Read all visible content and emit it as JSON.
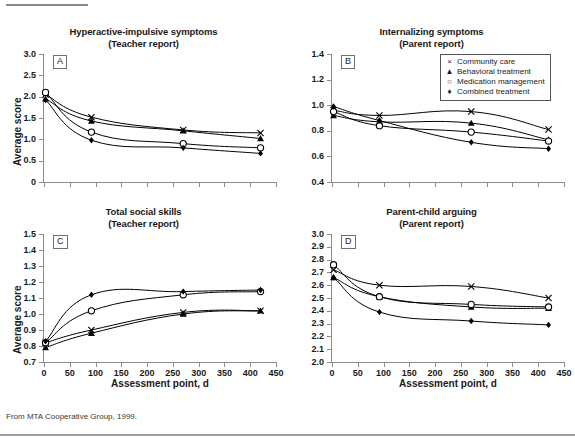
{
  "figure": {
    "top_fragment": "",
    "caption": "From MTA Cooperative Group, 1999.",
    "ylabel": "Average score",
    "xlabel": "Assessment point, d"
  },
  "legend": {
    "items": [
      {
        "marker": "cross-marker",
        "glyph": "×",
        "label": "Community care"
      },
      {
        "marker": "triangle-marker",
        "glyph": "▲",
        "label": "Behavioral treatment"
      },
      {
        "marker": "circle-marker",
        "glyph": "○",
        "label": "Medication management"
      },
      {
        "marker": "diamond-marker",
        "glyph": "♦",
        "label": "Combined treatment"
      }
    ]
  },
  "chart_data": [
    {
      "id": "A",
      "type": "line",
      "title": "Hyperactive-impulsive symptoms",
      "subtitle": "(Teacher report)",
      "xlabel": "Assessment point, d",
      "ylabel": "Average score",
      "xlim": [
        0,
        450
      ],
      "ylim": [
        0,
        3.0
      ],
      "yticks": [
        "0",
        "0.5",
        "1.0",
        "1.5",
        "2.0",
        "2.5",
        "3.0"
      ],
      "ytick_values": [
        0,
        0.5,
        1.0,
        1.5,
        2.0,
        2.5,
        3.0
      ],
      "xticks": [
        "",
        "",
        "",
        "",
        "",
        "",
        "",
        "",
        "",
        ""
      ],
      "xtick_values": [
        0,
        50,
        100,
        150,
        200,
        250,
        300,
        350,
        400,
        450
      ],
      "grid": false,
      "x": [
        3,
        92,
        270,
        420
      ],
      "series": [
        {
          "name": "Community care",
          "marker": "×",
          "values": [
            2.05,
            1.52,
            1.22,
            1.15
          ]
        },
        {
          "name": "Behavioral treatment",
          "marker": "▲",
          "values": [
            1.95,
            1.43,
            1.2,
            1.02
          ]
        },
        {
          "name": "Medication management",
          "marker": "○",
          "values": [
            2.1,
            1.17,
            0.9,
            0.8
          ]
        },
        {
          "name": "Combined treatment",
          "marker": "♦",
          "values": [
            1.92,
            0.98,
            0.8,
            0.67
          ]
        }
      ]
    },
    {
      "id": "B",
      "type": "line",
      "title": "Internalizing symptoms",
      "subtitle": "(Parent report)",
      "xlabel": "Assessment point, d",
      "ylabel": "Average score",
      "xlim": [
        0,
        450
      ],
      "ylim": [
        0.4,
        1.4
      ],
      "yticks": [
        "0.4",
        "0.6",
        "0.8",
        "1.0",
        "1.2",
        "1.4"
      ],
      "ytick_values": [
        0.4,
        0.6,
        0.8,
        1.0,
        1.2,
        1.4
      ],
      "xticks": [
        "",
        "",
        "",
        "",
        "",
        "",
        "",
        "",
        "",
        ""
      ],
      "xtick_values": [
        0,
        50,
        100,
        150,
        200,
        250,
        300,
        350,
        400,
        450
      ],
      "grid": false,
      "x": [
        3,
        92,
        270,
        420
      ],
      "series": [
        {
          "name": "Community care",
          "marker": "×",
          "values": [
            0.96,
            0.92,
            0.95,
            0.81
          ]
        },
        {
          "name": "Behavioral treatment",
          "marker": "▲",
          "values": [
            0.92,
            0.87,
            0.86,
            0.73
          ]
        },
        {
          "name": "Medication management",
          "marker": "○",
          "values": [
            0.95,
            0.84,
            0.79,
            0.72
          ]
        },
        {
          "name": "Combined treatment",
          "marker": "♦",
          "values": [
            0.99,
            0.88,
            0.71,
            0.66
          ]
        }
      ]
    },
    {
      "id": "C",
      "type": "line",
      "title": "Total social skills",
      "subtitle": "(Teacher report)",
      "xlabel": "Assessment point, d",
      "ylabel": "Average score",
      "xlim": [
        0,
        450
      ],
      "ylim": [
        0.7,
        1.5
      ],
      "yticks": [
        "0.7",
        "0.8",
        "0.9",
        "1.0",
        "1.1",
        "1.2",
        "1.3",
        "1.4",
        "1.5"
      ],
      "ytick_values": [
        0.7,
        0.8,
        0.9,
        1.0,
        1.1,
        1.2,
        1.3,
        1.4,
        1.5
      ],
      "xticks": [
        "0",
        "50",
        "100",
        "150",
        "200",
        "250",
        "300",
        "350",
        "400",
        "450"
      ],
      "xtick_values": [
        0,
        50,
        100,
        150,
        200,
        250,
        300,
        350,
        400,
        450
      ],
      "grid": false,
      "x": [
        3,
        92,
        270,
        420
      ],
      "series": [
        {
          "name": "Community care",
          "marker": "×",
          "values": [
            0.82,
            0.9,
            1.01,
            1.02
          ]
        },
        {
          "name": "Behavioral treatment",
          "marker": "▲",
          "values": [
            0.79,
            0.88,
            1.0,
            1.02
          ]
        },
        {
          "name": "Medication management",
          "marker": "○",
          "values": [
            0.82,
            1.02,
            1.12,
            1.14
          ]
        },
        {
          "name": "Combined treatment",
          "marker": "♦",
          "values": [
            0.83,
            1.12,
            1.14,
            1.15
          ]
        }
      ]
    },
    {
      "id": "D",
      "type": "line",
      "title": "Parent-child arguing",
      "subtitle": "(Parent report)",
      "xlabel": "Assessment point, d",
      "ylabel": "Average score",
      "xlim": [
        0,
        450
      ],
      "ylim": [
        2.0,
        3.0
      ],
      "yticks": [
        "2.0",
        "2.1",
        "2.2",
        "2.3",
        "2.4",
        "2.5",
        "2.6",
        "2.7",
        "2.8",
        "2.9",
        "3.0"
      ],
      "ytick_values": [
        2.0,
        2.1,
        2.2,
        2.3,
        2.4,
        2.5,
        2.6,
        2.7,
        2.8,
        2.9,
        3.0
      ],
      "xticks": [
        "0",
        "50",
        "100",
        "150",
        "200",
        "250",
        "300",
        "350",
        "400",
        "450"
      ],
      "xtick_values": [
        0,
        50,
        100,
        150,
        200,
        250,
        300,
        350,
        400,
        450
      ],
      "grid": false,
      "x": [
        3,
        92,
        270,
        420
      ],
      "series": [
        {
          "name": "Community care",
          "marker": "×",
          "values": [
            2.72,
            2.6,
            2.59,
            2.5
          ]
        },
        {
          "name": "Behavioral treatment",
          "marker": "▲",
          "values": [
            2.66,
            2.51,
            2.43,
            2.42
          ]
        },
        {
          "name": "Medication management",
          "marker": "○",
          "values": [
            2.76,
            2.51,
            2.45,
            2.43
          ]
        },
        {
          "name": "Combined treatment",
          "marker": "♦",
          "values": [
            2.66,
            2.39,
            2.32,
            2.29
          ]
        }
      ]
    }
  ]
}
